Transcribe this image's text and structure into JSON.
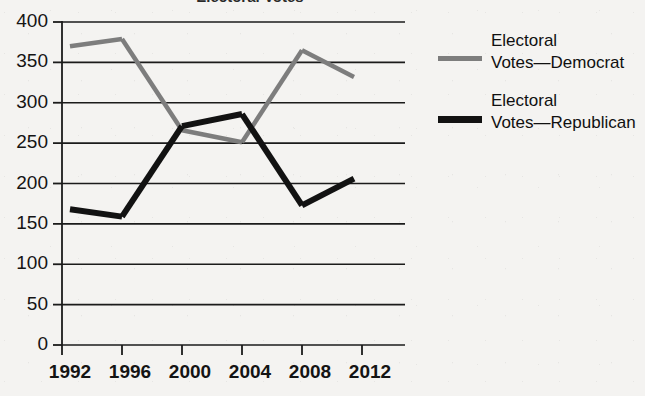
{
  "chart_data": {
    "type": "line",
    "title": "Electoral Votes",
    "xlabel": "",
    "ylabel": "",
    "x": [
      1992,
      1996,
      2000,
      2004,
      2008,
      2012
    ],
    "categories": [
      "1992",
      "1996",
      "2000",
      "2004",
      "2008",
      "2012"
    ],
    "series": [
      {
        "name": "Electoral Votes—Democrat",
        "color": "#7d7d7d",
        "values": [
          370,
          379,
          266,
          251,
          365,
          332
        ]
      },
      {
        "name": "Electoral Votes—Republican",
        "color": "#121212",
        "values": [
          168,
          159,
          271,
          286,
          173,
          206
        ]
      }
    ],
    "ylim": [
      0,
      400
    ],
    "yticks": [
      0,
      50,
      100,
      150,
      200,
      250,
      300,
      350,
      400
    ],
    "ytick_labels": [
      "0",
      "50",
      "100",
      "150",
      "200",
      "250",
      "300",
      "350",
      "400"
    ],
    "xtick_labels": [
      "1992",
      "1996",
      "2000",
      "2004",
      "2008",
      "2012"
    ],
    "grid": true,
    "legend_position": "right"
  },
  "legend": {
    "items": [
      {
        "label": "Electoral\nVotes—Democrat",
        "swatch": "dem"
      },
      {
        "label": "Electoral\nVotes—Republican",
        "swatch": "rep"
      }
    ]
  },
  "colors": {
    "democrat": "#7d7d7d",
    "republican": "#121212",
    "grid": "#1b1b1b",
    "axis": "#1b1b1b",
    "background": "#f4f3f1",
    "text": "#141414"
  }
}
